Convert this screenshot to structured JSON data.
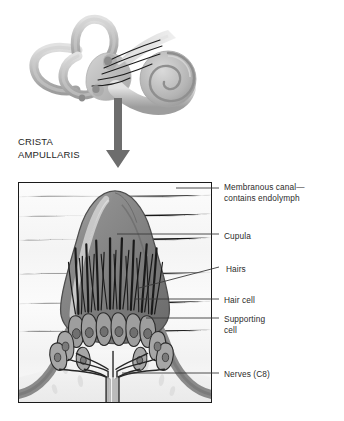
{
  "figure": {
    "title": "Crista Ampullaris",
    "section_heading": "CRISTA\nAMPULLARIS",
    "colors": {
      "text": "#2b2b2b",
      "leader_line": "#3a3a3a",
      "box_border": "#1a1a1a",
      "cupula_fill": "#8a8a8a",
      "cupula_dark": "#6e6e6e",
      "cupula_highlight": "#c9c9c9",
      "epithelium": "#9a9a9a",
      "hair_bundle": "#1e1e1e",
      "nerve": "#2a2a2a",
      "background": "#fdfdfd",
      "labyrinth_gray": "#b9b9b9",
      "arrow": "#6a6a6a"
    }
  },
  "labels": [
    {
      "id": "membranous-canal",
      "text": "Membranous canal—\ncontains endolymph",
      "text_x": 224,
      "text_y": 182,
      "leader": {
        "x1": 176,
        "y1": 188,
        "x2": 219,
        "y2": 188
      }
    },
    {
      "id": "cupula",
      "text": "Cupula",
      "text_x": 224,
      "text_y": 231,
      "leader": {
        "x1": 117,
        "y1": 234,
        "x2": 219,
        "y2": 234
      }
    },
    {
      "id": "hairs",
      "text": "Hairs",
      "text_x": 226,
      "text_y": 264,
      "leader": {
        "x1": 139,
        "y1": 288,
        "x2": 219,
        "y2": 267
      }
    },
    {
      "id": "hair-cell",
      "text": "Hair cell",
      "text_x": 224,
      "text_y": 295,
      "leader": {
        "x1": 134,
        "y1": 299,
        "x2": 219,
        "y2": 299
      }
    },
    {
      "id": "supporting-cell",
      "text": "Supporting\ncell",
      "text_x": 224,
      "text_y": 314,
      "leader": {
        "x1": 146,
        "y1": 318,
        "x2": 219,
        "y2": 318
      }
    },
    {
      "id": "nerves",
      "text": "Nerves (C8)",
      "text_x": 224,
      "text_y": 369,
      "leader": {
        "x1": 122,
        "y1": 373,
        "x2": 219,
        "y2": 373
      }
    }
  ],
  "anatomy": {
    "labyrinth": {
      "name": "bony-labyrinth",
      "parts": [
        "anterior-semicircular-canal",
        "posterior-semicircular-canal",
        "lateral-semicircular-canal",
        "vestibule",
        "cochlea",
        "vestibulocochlear-nerve"
      ]
    },
    "crista": {
      "name": "crista-ampullaris",
      "parts": [
        "cupula",
        "hair-bundles",
        "hair-cells",
        "supporting-cells",
        "nerve-fibers",
        "membranous-canal-wall"
      ]
    },
    "arrow": {
      "label": "magnification-arrow",
      "direction": "down"
    }
  }
}
